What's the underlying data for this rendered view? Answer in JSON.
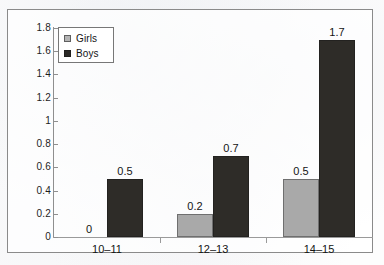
{
  "chart_data": {
    "type": "bar",
    "title": "",
    "subtitle": "",
    "xlabel": "",
    "ylabel": "",
    "categories": [
      "10–11",
      "12–13",
      "14–15"
    ],
    "series": [
      {
        "name": "Girls",
        "values": [
          0,
          0.2,
          0.5
        ],
        "color": "#a9a9a9"
      },
      {
        "name": "Boys",
        "values": [
          0.5,
          0.7,
          1.7
        ],
        "color": "#2e2c28"
      }
    ],
    "point_labels": {
      "Girls": [
        "0",
        "0.2",
        "0.5"
      ],
      "Boys": [
        "0.5",
        "0.7",
        "1.7"
      ]
    },
    "ylim": [
      0,
      1.8
    ],
    "ytick_values": [
      0,
      0.2,
      0.4,
      0.6,
      0.8,
      1,
      1.2,
      1.4,
      1.6,
      1.8
    ],
    "ytick_labels": [
      "0",
      "0.2",
      "0.4",
      "0.6",
      "0.8",
      "1",
      "1.2",
      "1.4",
      "1.6",
      "1.8"
    ],
    "grid": false,
    "legend_position": "top-left",
    "legend_entries": [
      "Girls",
      "Boys"
    ]
  },
  "legend": {
    "entries": [
      {
        "label": "Girls",
        "swatch": "girls-swatch"
      },
      {
        "label": "Boys",
        "swatch": "boys-swatch"
      }
    ]
  },
  "colors": {
    "girls_bar": "#a9a9a9",
    "boys_bar": "#2e2c28",
    "axis": "#8f8f8f",
    "frame": "#8a8a8a",
    "text": "#141414",
    "background": "#fdfdfd"
  }
}
